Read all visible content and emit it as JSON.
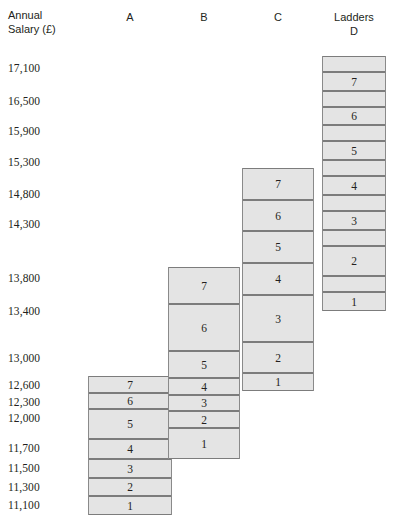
{
  "axis": {
    "title": "Annual\nSalary (£)",
    "ticks": [
      {
        "label": "17,100",
        "value": 17100,
        "y": 62
      },
      {
        "label": "16,500",
        "value": 16500,
        "y": 95
      },
      {
        "label": "15,900",
        "value": 15900,
        "y": 125
      },
      {
        "label": "15,300",
        "value": 15300,
        "y": 156
      },
      {
        "label": "14,800",
        "value": 14800,
        "y": 188
      },
      {
        "label": "14,300",
        "value": 14300,
        "y": 218
      },
      {
        "label": "13,800",
        "value": 13800,
        "y": 272
      },
      {
        "label": "13,400",
        "value": 13400,
        "y": 305
      },
      {
        "label": "13,000",
        "value": 13000,
        "y": 352
      },
      {
        "label": "12,600",
        "value": 12600,
        "y": 379
      },
      {
        "label": "12,300",
        "value": 12300,
        "y": 396
      },
      {
        "label": "12,000",
        "value": 12000,
        "y": 412
      },
      {
        "label": "11,700",
        "value": 11700,
        "y": 442
      },
      {
        "label": "11,500",
        "value": 11500,
        "y": 462
      },
      {
        "label": "11,300",
        "value": 11300,
        "y": 481
      },
      {
        "label": "11,100",
        "value": 11100,
        "y": 499
      }
    ]
  },
  "headers": [
    {
      "name": "header-a",
      "text": "A",
      "x": 88,
      "w": 84,
      "y": 10
    },
    {
      "name": "header-b",
      "text": "B",
      "x": 168,
      "w": 72,
      "y": 10
    },
    {
      "name": "header-c",
      "text": "C",
      "x": 242,
      "w": 72,
      "y": 10
    },
    {
      "name": "header-d",
      "text": "Ladders\nD",
      "x": 322,
      "w": 64,
      "y": 10
    }
  ],
  "colors": {
    "block_fill": "#e4e4e4",
    "block_border": "#8a8a8a",
    "rung_border": "#7c7c7c",
    "text": "#231f20",
    "background": "#ffffff"
  },
  "chart_data": {
    "type": "bar",
    "title": "",
    "xlabel": "Ladders",
    "ylabel": "Annual Salary (£)",
    "ylim": [
      11100,
      17400
    ],
    "grid": false,
    "legend": "none",
    "note": "Four salary ladders A-D. Each ladder is a stack of numbered pay-scale rungs drawn as boxes; ladder D additionally shows unlabelled spacer bands between its numbered rungs.",
    "categories": [
      "A",
      "B",
      "C",
      "D"
    ],
    "axis_tick_values": [
      17100,
      16500,
      15900,
      15300,
      14800,
      14300,
      13800,
      13400,
      13000,
      12600,
      12300,
      12000,
      11700,
      11500,
      11300,
      11100
    ],
    "ladders": [
      {
        "name": "A",
        "bottom_value": 11100,
        "top_value": 12600,
        "x": 88,
        "width": 84,
        "rungs": [
          {
            "label": "7",
            "top": 376,
            "height": 17
          },
          {
            "label": "6",
            "top": 393,
            "height": 16
          },
          {
            "label": "5",
            "top": 409,
            "height": 30
          },
          {
            "label": "4",
            "top": 439,
            "height": 20
          },
          {
            "label": "3",
            "top": 459,
            "height": 19
          },
          {
            "label": "2",
            "top": 478,
            "height": 18
          },
          {
            "label": "1",
            "top": 496,
            "height": 19
          }
        ]
      },
      {
        "name": "B",
        "bottom_value": 11700,
        "top_value": 13800,
        "x": 168,
        "width": 72,
        "rungs": [
          {
            "label": "7",
            "top": 267,
            "height": 37
          },
          {
            "label": "6",
            "top": 304,
            "height": 47
          },
          {
            "label": "5",
            "top": 351,
            "height": 27
          },
          {
            "label": "4",
            "top": 378,
            "height": 17
          },
          {
            "label": "3",
            "top": 395,
            "height": 16
          },
          {
            "label": "2",
            "top": 411,
            "height": 17
          },
          {
            "label": "1",
            "top": 428,
            "height": 31
          }
        ]
      },
      {
        "name": "C",
        "bottom_value": 12600,
        "top_value": 15300,
        "x": 242,
        "width": 72,
        "rungs": [
          {
            "label": "7",
            "top": 168,
            "height": 32
          },
          {
            "label": "6",
            "top": 200,
            "height": 31
          },
          {
            "label": "5",
            "top": 231,
            "height": 32
          },
          {
            "label": "4",
            "top": 263,
            "height": 32
          },
          {
            "label": "3",
            "top": 295,
            "height": 47
          },
          {
            "label": "2",
            "top": 342,
            "height": 31
          },
          {
            "label": "1",
            "top": 373,
            "height": 18
          }
        ]
      },
      {
        "name": "D",
        "bottom_value": 13400,
        "top_value": 17400,
        "x": 322,
        "width": 64,
        "rungs": [
          {
            "label": "",
            "top": 56,
            "height": 16
          },
          {
            "label": "7",
            "top": 72,
            "height": 19
          },
          {
            "label": "",
            "top": 91,
            "height": 16
          },
          {
            "label": "6",
            "top": 107,
            "height": 18
          },
          {
            "label": "",
            "top": 125,
            "height": 16
          },
          {
            "label": "5",
            "top": 141,
            "height": 19
          },
          {
            "label": "",
            "top": 160,
            "height": 16
          },
          {
            "label": "4",
            "top": 176,
            "height": 19
          },
          {
            "label": "",
            "top": 195,
            "height": 16
          },
          {
            "label": "3",
            "top": 211,
            "height": 19
          },
          {
            "label": "",
            "top": 230,
            "height": 16
          },
          {
            "label": "2",
            "top": 246,
            "height": 30
          },
          {
            "label": "",
            "top": 276,
            "height": 16
          },
          {
            "label": "1",
            "top": 292,
            "height": 19
          }
        ]
      }
    ]
  }
}
